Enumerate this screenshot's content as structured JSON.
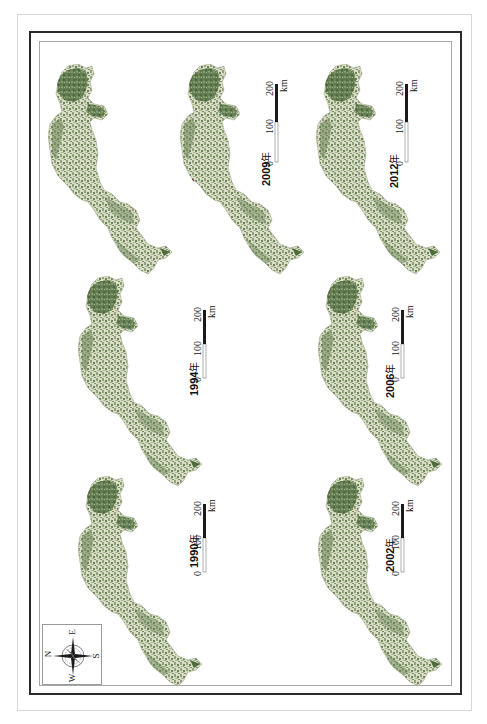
{
  "figure": {
    "type": "multi-panel land-cover map series (rotated 90°)",
    "colors": {
      "forest_dark": "#4e6b3e",
      "forest_mid": "#7d9468",
      "land_light": "#e9ead9",
      "border": "#2a2a2a",
      "background": "#ffffff"
    },
    "panels": [
      {
        "year": "1998",
        "suffix": "年",
        "position": "top-left"
      },
      {
        "year": "2009",
        "suffix": "年",
        "position": "top-center"
      },
      {
        "year": "2012",
        "suffix": "年",
        "position": "top-right"
      },
      {
        "year": "1994",
        "suffix": "年",
        "position": "middle-left"
      },
      {
        "year": "2006",
        "suffix": "年",
        "position": "middle-right"
      },
      {
        "year": "1990",
        "suffix": "年",
        "position": "bottom-left"
      },
      {
        "year": "2002",
        "suffix": "年",
        "position": "bottom-right"
      }
    ],
    "scale_bar": {
      "ticks": [
        "0",
        "100",
        "200"
      ],
      "unit": "km"
    },
    "compass": {
      "N": "N",
      "E": "E",
      "S": "S",
      "W": "W"
    }
  }
}
